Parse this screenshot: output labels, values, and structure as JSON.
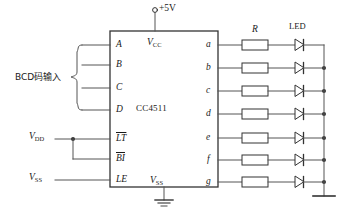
{
  "figure": {
    "type": "schematic-circuit-diagram",
    "chip": {
      "name": "CC4511",
      "vcc_label": "V",
      "vcc_sub": "CC",
      "vss_label": "V",
      "vss_sub": "SS",
      "left_pins": [
        {
          "label": "A",
          "overline": false
        },
        {
          "label": "B",
          "overline": false
        },
        {
          "label": "C",
          "overline": false
        },
        {
          "label": "D",
          "overline": false
        },
        {
          "label": "LT",
          "overline": true
        },
        {
          "label": "BI",
          "overline": true
        },
        {
          "label": "LE",
          "overline": false
        }
      ],
      "right_pins": [
        {
          "label": "a"
        },
        {
          "label": "b"
        },
        {
          "label": "c"
        },
        {
          "label": "d"
        },
        {
          "label": "e"
        },
        {
          "label": "f"
        },
        {
          "label": "g"
        }
      ]
    },
    "supply": {
      "top_label": "+5V",
      "vdd_label": "V",
      "vdd_sub": "DD",
      "vss_left_label": "V",
      "vss_left_sub": "SS"
    },
    "annotations": {
      "bcd_input": "BCD码输入",
      "resistor_label": "R",
      "led_label": "LED"
    },
    "colors": {
      "line": "#555555",
      "line_dark": "#333333",
      "text": "#1a1a1a",
      "background": "#ffffff"
    }
  }
}
